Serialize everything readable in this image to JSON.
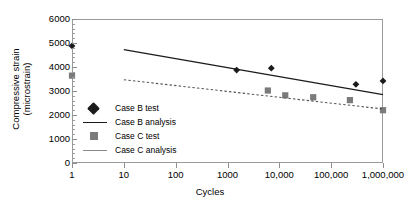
{
  "chart_data": {
    "type": "scatter",
    "title": "",
    "xlabel": "Cycles",
    "ylabel": "Compressive strain (microstrain)",
    "xlabel_line1": "Compressive strain",
    "xlabel_line2": "(microstrain)",
    "xscale": "log",
    "xlim": [
      1,
      1000000
    ],
    "ylim": [
      0,
      6000
    ],
    "grid": false,
    "legend_position": "inside-lower-left",
    "xticks": [
      1,
      10,
      100,
      1000,
      10000,
      100000,
      1000000
    ],
    "xtick_labels": [
      "1",
      "10",
      "100",
      "1000",
      "10,000",
      "100,000",
      "1,000,000"
    ],
    "yticks": [
      0,
      1000,
      2000,
      3000,
      4000,
      5000,
      6000
    ],
    "ytick_labels": [
      "0",
      "1000",
      "2000",
      "3000",
      "4000",
      "5000",
      "6000"
    ],
    "series": [
      {
        "name": "Case B test",
        "type": "scatter",
        "marker": "diamond",
        "color": "#1b1b1b",
        "points": [
          {
            "x": 1,
            "y": 4880
          },
          {
            "x": 1500,
            "y": 3870
          },
          {
            "x": 7000,
            "y": 3950
          },
          {
            "x": 300000,
            "y": 3280
          },
          {
            "x": 1000000,
            "y": 3420
          }
        ]
      },
      {
        "name": "Case B analysis",
        "type": "line",
        "style": "solid",
        "color": "#1b1b1b",
        "points": [
          {
            "x": 10,
            "y": 4720
          },
          {
            "x": 1000000,
            "y": 2850
          }
        ]
      },
      {
        "name": "Case C test",
        "type": "scatter",
        "marker": "square",
        "color": "#7b7b7b",
        "points": [
          {
            "x": 1,
            "y": 3640
          },
          {
            "x": 6000,
            "y": 3020
          },
          {
            "x": 13000,
            "y": 2820
          },
          {
            "x": 45000,
            "y": 2740
          },
          {
            "x": 230000,
            "y": 2620
          },
          {
            "x": 1000000,
            "y": 2200
          }
        ]
      },
      {
        "name": "Case C analysis",
        "type": "line",
        "style": "dashed",
        "color": "#555555",
        "points": [
          {
            "x": 10,
            "y": 3470
          },
          {
            "x": 1000000,
            "y": 2250
          }
        ]
      }
    ],
    "legend_entries": [
      {
        "label": "Case B test",
        "key": "diamond-marker"
      },
      {
        "label": "Case B analysis",
        "key": "solid-line"
      },
      {
        "label": "Case C test",
        "key": "square-marker"
      },
      {
        "label": "Case C analysis",
        "key": "gray-line"
      }
    ]
  }
}
